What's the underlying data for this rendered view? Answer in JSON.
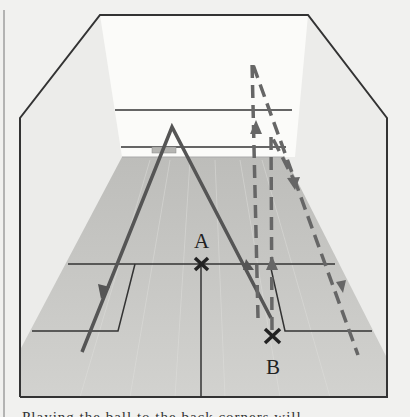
{
  "figure": {
    "points": [
      {
        "label": "A",
        "position": "T (center of short line)"
      },
      {
        "label": "B",
        "position": "right back court"
      }
    ],
    "paths": [
      {
        "name": "solid-shot",
        "style": "solid",
        "description": "Lob from left back court hitting front wall and landing near B"
      },
      {
        "name": "dashed-shots",
        "style": "dashed",
        "description": "Straight drives along the right wall from B"
      }
    ],
    "colors": {
      "background": "#f1f1ef",
      "front_wall": "#fafaf8",
      "side_wall": "#ebebe9",
      "floor": "#c9c9c6",
      "lines": "#333333",
      "path": "#555555"
    }
  },
  "labels": {
    "a": "A",
    "b": "B"
  },
  "caption": {
    "text": "Playing the ball to the back corners will..."
  }
}
